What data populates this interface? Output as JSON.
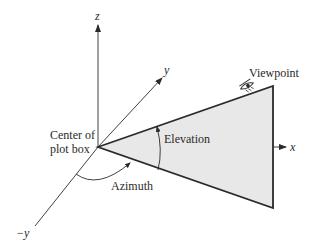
{
  "diagram": {
    "axes": {
      "z": "z",
      "y": "y",
      "neg_y": "−y",
      "x": "x"
    },
    "labels": {
      "center_line1": "Center of",
      "center_line2": "plot box",
      "viewpoint": "Viewpoint",
      "elevation": "Elevation",
      "azimuth": "Azimuth"
    },
    "colors": {
      "line": "#2a2a2a",
      "triangle_fill": "#e8e8e8",
      "background": "#ffffff"
    },
    "icons": {
      "viewpoint_marker": "eye-icon"
    }
  }
}
